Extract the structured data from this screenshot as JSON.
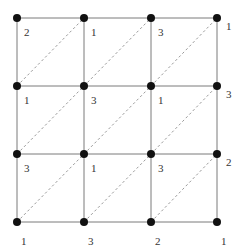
{
  "diagram": {
    "type": "grid-graph",
    "rows": 4,
    "cols": 4,
    "col_x": [
      17,
      84,
      151,
      217
    ],
    "row_y": [
      18,
      86,
      154,
      222
    ],
    "node_radius": 4,
    "colors": {
      "grid_line": "#7a7a7a",
      "diagonal_line": "#9a9a9a",
      "node": "#111111",
      "label": "#333333"
    },
    "diagonal_style": "dashed",
    "diagonal_direction": "bottom-left-to-top-right",
    "labels": [
      [
        "2",
        "1",
        "3",
        "1"
      ],
      [
        "1",
        "3",
        "1",
        "3"
      ],
      [
        "3",
        "1",
        "3",
        "2"
      ],
      [
        "1",
        "3",
        "2",
        "1"
      ]
    ]
  }
}
